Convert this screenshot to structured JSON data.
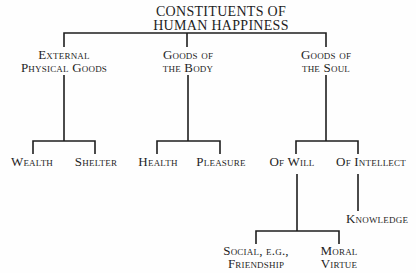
{
  "title": {
    "line1": "CONSTITUENTS OF",
    "line2": "HUMAN HAPPINESS"
  },
  "categories": [
    {
      "line1": "External",
      "line2": "Physical Goods"
    },
    {
      "line1": "Goods of",
      "line2": "the Body"
    },
    {
      "line1": "Goods of",
      "line2": "the Soul"
    }
  ],
  "leaves": {
    "wealth": "Wealth",
    "shelter": "Shelter",
    "health": "Health",
    "pleasure": "Pleasure",
    "of_will": "Of Will",
    "of_intellect": "Of Intellect",
    "knowledge": "Knowledge",
    "social": {
      "line1": "Social, e.g.,",
      "line2": "Friendship"
    },
    "moral": {
      "line1": "Moral",
      "line2": "Virtue"
    }
  },
  "colors": {
    "line": "#1e1e1e",
    "background": "#fefefe"
  }
}
